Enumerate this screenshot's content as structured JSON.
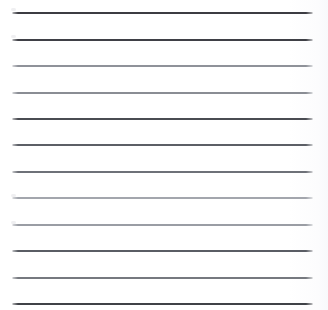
{
  "document": {
    "type": "ruled-paper-sheet",
    "title": "Lined Paper",
    "description": "Blank ruled notebook paper scan with horizontal rule lines and no written text",
    "width_px": 328,
    "height_px": 310,
    "background_color": "#ffffff",
    "content_text": "",
    "line_count": 12
  },
  "ruling": {
    "left_x": 12,
    "right_x": 313,
    "line_length": 301,
    "spacing_px": 26.3,
    "thickness_px": 2,
    "first_line_y": 13,
    "last_line_y": 304,
    "ink_colors": {
      "dark": "#3c3c42",
      "medium": "#585b62",
      "light": "#8f9299",
      "lighter": "#a3a6ad"
    },
    "lines": [
      {
        "index": 1,
        "y": 13,
        "color": "#3c3c42",
        "weight": "dark"
      },
      {
        "index": 2,
        "y": 40,
        "color": "#3f4046",
        "weight": "dark"
      },
      {
        "index": 3,
        "y": 66,
        "color": "#8f9299",
        "weight": "light"
      },
      {
        "index": 4,
        "y": 93,
        "color": "#8a8d94",
        "weight": "light"
      },
      {
        "index": 5,
        "y": 119,
        "color": "#4a4c52",
        "weight": "dark"
      },
      {
        "index": 6,
        "y": 145,
        "color": "#5c5f66",
        "weight": "medium"
      },
      {
        "index": 7,
        "y": 172,
        "color": "#6e7178",
        "weight": "medium"
      },
      {
        "index": 8,
        "y": 198,
        "color": "#a3a6ad",
        "weight": "lighter"
      },
      {
        "index": 9,
        "y": 225,
        "color": "#9a9da4",
        "weight": "light"
      },
      {
        "index": 10,
        "y": 251,
        "color": "#5a5d64",
        "weight": "medium"
      },
      {
        "index": 11,
        "y": 278,
        "color": "#76797f",
        "weight": "medium"
      },
      {
        "index": 12,
        "y": 304,
        "color": "#404247",
        "weight": "dark"
      }
    ],
    "tip_specks": [
      {
        "x": 11,
        "y": 8
      },
      {
        "x": 11,
        "y": 35
      },
      {
        "x": 11,
        "y": 194
      },
      {
        "x": 11,
        "y": 221
      }
    ]
  }
}
